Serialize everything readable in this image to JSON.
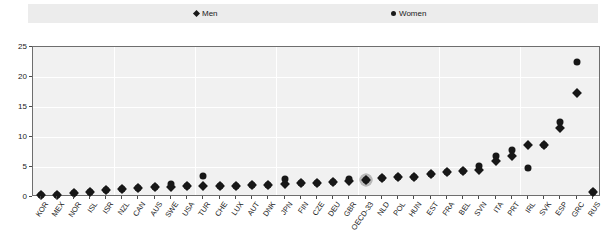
{
  "legend": {
    "men": {
      "label": "Men",
      "marker": "diamond-marker-icon"
    },
    "women": {
      "label": "Women",
      "marker": "circle-marker-icon"
    }
  },
  "axes": {
    "y_ticks": [
      "0",
      "5",
      "10",
      "15",
      "20",
      "25"
    ],
    "y_min": 0,
    "y_max": 25
  },
  "highlight": {
    "category": "OECD-33"
  },
  "chart_data": {
    "type": "scatter",
    "title": "",
    "subtitle": "",
    "xlabel": "",
    "ylabel": "",
    "ylim": [
      0,
      25
    ],
    "yticks": [
      0,
      5,
      10,
      15,
      20,
      25
    ],
    "grid": true,
    "legend_position": "top",
    "highlight_category": "OECD-33",
    "categories": [
      "KOR",
      "MEX",
      "NOR",
      "ISL",
      "ISR",
      "NZL",
      "CAN",
      "AUS",
      "SWE",
      "USA",
      "TUR",
      "CHE",
      "LUX",
      "AUT",
      "DNK",
      "JPN",
      "FIN",
      "CZE",
      "DEU",
      "GBR",
      "OECD-33",
      "NLD",
      "POL",
      "HUN",
      "EST",
      "FRA",
      "BEL",
      "SVN",
      "ITA",
      "PRT",
      "IRL",
      "SVK",
      "ESP",
      "GRC",
      "RUS"
    ],
    "series": [
      {
        "name": "Men",
        "marker": "diamond",
        "values": [
          0.3,
          0.4,
          0.7,
          0.9,
          1.1,
          1.3,
          1.5,
          1.6,
          1.7,
          1.8,
          1.8,
          1.9,
          1.9,
          2.0,
          2.0,
          2.2,
          2.3,
          2.4,
          2.5,
          2.6,
          2.9,
          3.1,
          3.3,
          3.4,
          3.8,
          4.1,
          4.3,
          4.5,
          6.0,
          6.9,
          8.7,
          8.6,
          11.5,
          17.3,
          0.8
        ]
      },
      {
        "name": "Women",
        "marker": "circle",
        "values": [
          0.3,
          0.4,
          0.7,
          0.9,
          1.1,
          1.3,
          1.5,
          1.6,
          2.2,
          1.8,
          3.5,
          1.9,
          1.9,
          2.0,
          2.0,
          3.0,
          2.3,
          2.4,
          2.5,
          3.0,
          2.9,
          3.1,
          3.3,
          3.4,
          3.8,
          4.1,
          4.3,
          5.1,
          6.9,
          7.8,
          4.8,
          8.6,
          12.5,
          22.5,
          0.8
        ]
      }
    ]
  }
}
